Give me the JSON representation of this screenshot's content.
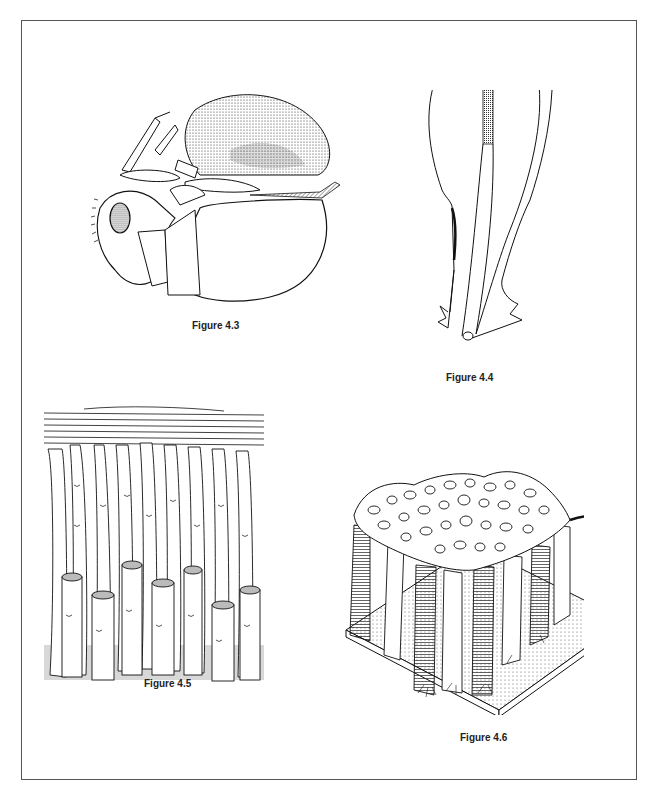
{
  "page": {
    "background": "#ffffff",
    "border_color": "#555555"
  },
  "figures": [
    {
      "id": "4.3",
      "caption": "Figure 4.3",
      "subject": "insect-head-lateral-view"
    },
    {
      "id": "4.4",
      "caption": "Figure 4.4",
      "subject": "mouthpart-stylets"
    },
    {
      "id": "4.5",
      "caption": "Figure 4.5",
      "subject": "columnar-tubular-structure"
    },
    {
      "id": "4.6",
      "caption": "Figure 4.6",
      "subject": "perforated-plate-on-pillars-block"
    }
  ]
}
